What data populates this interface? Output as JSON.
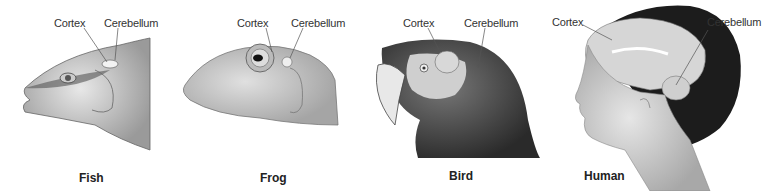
{
  "figure": {
    "panels": [
      {
        "animal": "Fish",
        "labels": [
          "Cortex",
          "Cerebellum"
        ]
      },
      {
        "animal": "Frog",
        "labels": [
          "Cortex",
          "Cerebellum"
        ]
      },
      {
        "animal": "Bird",
        "labels": [
          "Cortex",
          "Cerebellum"
        ]
      },
      {
        "animal": "Human",
        "labels": [
          "Cortex",
          "Cerebellum"
        ]
      }
    ]
  }
}
